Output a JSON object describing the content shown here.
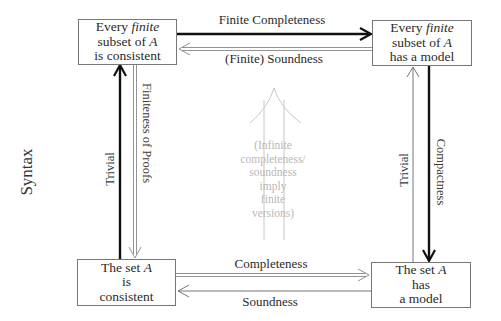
{
  "diagram": {
    "side_label": "Syntax",
    "boxes": {
      "top_left": {
        "line1_pre": "Every ",
        "line1_em": "finite",
        "line2_pre": "subset of ",
        "line2_em": "A",
        "line3": "is consistent"
      },
      "top_right": {
        "line1_pre": "Every ",
        "line1_em": "finite",
        "line2_pre": "subset of ",
        "line2_em": "A",
        "line3": "has a model"
      },
      "bottom_left": {
        "line1_pre": "The set ",
        "line1_em": "A",
        "line2": "is",
        "line3": "consistent"
      },
      "bottom_right": {
        "line1_pre": "The set ",
        "line1_em": "A",
        "line2": "has",
        "line3": "a model"
      }
    },
    "arrows": {
      "top_forward": "Finite Completeness",
      "top_backward": "(Finite) Soundness",
      "bottom_forward": "Completeness",
      "bottom_backward": "Soundness",
      "left_up": "Trivial",
      "left_down": "Finiteness of Proofs",
      "right_up": "Trivial",
      "right_down": "Compactness"
    },
    "center_note": {
      "lines": [
        "(Infinite",
        "completeness/",
        "soundness",
        "imply",
        "finite",
        "versions)"
      ]
    },
    "colors": {
      "thick_arrow": "#111111",
      "thin_arrow": "#777777",
      "ghost": "#c4c4c4",
      "box_border": "#777777"
    }
  }
}
